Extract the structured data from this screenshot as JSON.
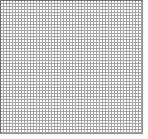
{
  "image": {
    "kind": "grid-pattern",
    "description": "Uniform fine graph-paper mesh of gray lines on white",
    "width_px": 148,
    "height_px": 139
  },
  "grid": {
    "name": "fine-mesh-grid",
    "origin_x_px": 0,
    "origin_y_px": 0,
    "width_px": 143,
    "height_px": 134,
    "cell_pitch_px": 3,
    "line_thickness_px": 1,
    "columns": 48,
    "rows": 45,
    "line_color": "#8e8e8e",
    "cell_color": "#ffffff",
    "frame_color": "#6f6f6f"
  },
  "margins": {
    "right_px": 5,
    "bottom_px": 5,
    "color": "#ffffff"
  },
  "labels": {
    "grid_region": "",
    "top_edge": "",
    "left_edge": "",
    "right_edge": "",
    "bottom_edge": ""
  }
}
